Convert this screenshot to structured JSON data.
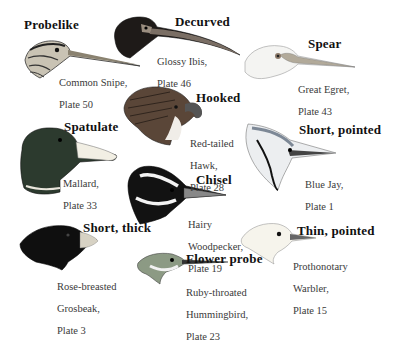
{
  "figure": {
    "background": "#ffffff",
    "bill_types": [
      {
        "type": "Probelike",
        "bird": "Common Snipe,",
        "plate": "Plate 50"
      },
      {
        "type": "Decurved",
        "bird": "Glossy Ibis,",
        "plate": "Plate 46"
      },
      {
        "type": "Spear",
        "bird": "Great Egret,",
        "plate": "Plate 43"
      },
      {
        "type": "Hooked",
        "bird": "Red-tailed",
        "bird2": "Hawk,",
        "plate": "Plate 28"
      },
      {
        "type": "Spatulate",
        "bird": "Mallard,",
        "plate": "Plate 33"
      },
      {
        "type": "Short, pointed",
        "bird": "Blue Jay,",
        "plate": "Plate 1"
      },
      {
        "type": "Chisel",
        "bird": "Hairy",
        "bird2": "Woodpecker,",
        "plate": "Plate 19"
      },
      {
        "type": "Short, thick",
        "bird": "Rose-breasted",
        "bird2": "Grosbeak,",
        "plate": "Plate 3"
      },
      {
        "type": "Flower probe",
        "bird": "Ruby-throated",
        "bird2": "Hummingbird,",
        "plate": "Plate 23"
      },
      {
        "type": "Thin, pointed",
        "bird": "Prothonotary",
        "bird2": "Warbler,",
        "plate": "Plate 15"
      }
    ]
  }
}
